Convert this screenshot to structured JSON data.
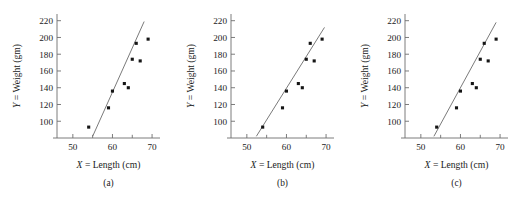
{
  "figure": {
    "panel_count": 3,
    "shared_xlabel": "X = Length (cm)",
    "shared_ylabel": "Y = Weight (gm)"
  },
  "chart_data": [
    {
      "type": "scatter",
      "title": "",
      "caption": "(a)",
      "xlabel": "X = Length (cm)",
      "ylabel": "Y = Weight (gm)",
      "xlim": [
        46,
        72
      ],
      "ylim": [
        80,
        228
      ],
      "xticks": [
        50,
        60,
        70
      ],
      "xticks_minor": [
        55,
        65
      ],
      "yticks": [
        100,
        120,
        140,
        160,
        180,
        200,
        220
      ],
      "grid": false,
      "legend": "none",
      "x": [
        54,
        59,
        60,
        63,
        64,
        65,
        66,
        67,
        69
      ],
      "y": [
        93,
        116,
        136,
        145,
        140,
        174,
        193,
        172,
        198
      ],
      "line": {
        "x1": 55.0,
        "y1": 82,
        "x2": 68.0,
        "y2": 219,
        "slope": 10.5,
        "intercept": -495.0
      }
    },
    {
      "type": "scatter",
      "title": "",
      "caption": "(b)",
      "xlabel": "X = Length (cm)",
      "ylabel": "Y = Weight (gm)",
      "xlim": [
        46,
        72
      ],
      "ylim": [
        80,
        228
      ],
      "xticks": [
        50,
        60,
        70
      ],
      "xticks_minor": [
        55,
        65
      ],
      "yticks": [
        100,
        120,
        140,
        160,
        180,
        200,
        220
      ],
      "grid": false,
      "legend": "none",
      "x": [
        54,
        59,
        60,
        63,
        64,
        65,
        66,
        67,
        69
      ],
      "y": [
        93,
        116,
        136,
        145,
        140,
        174,
        193,
        172,
        198
      ],
      "line": {
        "x1": 52.4,
        "y1": 82,
        "x2": 69.6,
        "y2": 212,
        "slope": 7.56,
        "intercept": -314.0
      }
    },
    {
      "type": "scatter",
      "title": "",
      "caption": "(c)",
      "xlabel": "X = Length (cm)",
      "ylabel": "Y = Weight (gm)",
      "xlim": [
        46,
        72
      ],
      "ylim": [
        80,
        228
      ],
      "xticks": [
        50,
        60,
        70
      ],
      "xticks_minor": [
        55,
        65
      ],
      "yticks": [
        100,
        120,
        140,
        160,
        180,
        200,
        220
      ],
      "grid": false,
      "legend": "none",
      "x": [
        54,
        59,
        60,
        63,
        64,
        65,
        66,
        67,
        69
      ],
      "y": [
        93,
        116,
        136,
        145,
        140,
        174,
        193,
        172,
        198
      ],
      "line": {
        "x1": 53.3,
        "y1": 82,
        "x2": 69.0,
        "y2": 218,
        "slope": 8.66,
        "intercept": -379.6
      }
    }
  ],
  "panels": [
    {
      "caption": "(a)",
      "xlabel_var": "X",
      "xlabel_eq": " = Length (cm)",
      "ylabel_var": "Y",
      "ylabel_eq": " = Weight (gm)",
      "xticklabels": [
        "50",
        "60",
        "70"
      ],
      "yticklabels": [
        "220",
        "200",
        "180",
        "160",
        "140",
        "120",
        "100"
      ]
    },
    {
      "caption": "(b)",
      "xlabel_var": "X",
      "xlabel_eq": " = Length (cm)",
      "ylabel_var": "Y",
      "ylabel_eq": " = Weight (gm)",
      "xticklabels": [
        "50",
        "60",
        "70"
      ],
      "yticklabels": [
        "220",
        "200",
        "180",
        "160",
        "140",
        "120",
        "100"
      ]
    },
    {
      "caption": "(c)",
      "xlabel_var": "X",
      "xlabel_eq": " = Length (cm)",
      "ylabel_var": "Y",
      "ylabel_eq": " = Weight (gm)",
      "xticklabels": [
        "50",
        "60",
        "70"
      ],
      "yticklabels": [
        "220",
        "200",
        "180",
        "160",
        "140",
        "120",
        "100"
      ]
    }
  ],
  "colors": {
    "point": "#151515",
    "line": "#6b6b6b",
    "axis": "#6e6e6e",
    "text": "#1a1a1a",
    "background": "#ffffff"
  }
}
